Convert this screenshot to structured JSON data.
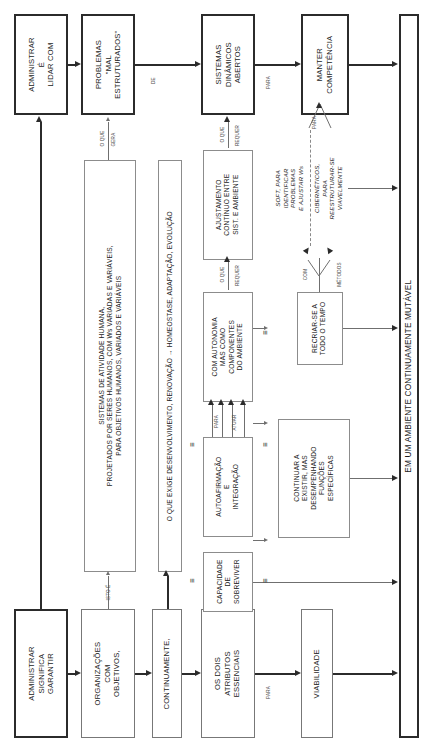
{
  "diagram": {
    "language": "pt-BR",
    "orientation": "rotated-90-ccw",
    "colors": {
      "ink": "#1a1a1a",
      "thick_border": "#2b2b2b",
      "thin_border": "#8c8c8c",
      "connector": "#2b2b2b",
      "connector_light": "#6f6f6f",
      "background": "#ffffff"
    }
  },
  "boxes": {
    "administrar_lidar": "ADMINISTRAR\nÉ\nLIDAR COM",
    "problemas_mal_estruturados": "PROBLEMAS\n\"MAL\nESTRUTURADOS\"",
    "sistemas_dinamicos_abertos": "SISTEMAS\nDINÂMICOS\nABERTOS",
    "manter_competencia": "MANTER\nCOMPETÊNCIA",
    "administrar_significa_garantir": "ADMINISTRAR\nSIGNIFICA\nGARANTIR",
    "organizacoes_com_objetivos": "ORGANIZAÇÕES\nCOM\nOBJETIVOS,",
    "continuamente": "CONTINUAMENTE,",
    "os_dois_atributos_essenciais": "OS DOIS\nATRIBUTOS\nESSENCIAIS",
    "viabilidade": "VIABILIDADE",
    "sistemas_atividade_humana": "SISTEMAS DE ATIVIDADE HUMANA,\nPROJETADOS POR SERES HUMANOS, COM Ws VARIADAS E VARIÁVEIS,\nPARA OBJETIVOS HUMANOS, VARIADOS E VARIÁVEIS",
    "o_que_exige": "O QUE EXIGE DESENVOLVIMENTO, RENOVAÇÃO → HOMEOSTASE, ADAPTAÇÃO, EVOLUÇÃO",
    "ajustamento_continuo": "AJUSTAMENTO\nCONTÍNUO ENTRE\nSIST. E AMBIENTE",
    "com_autonomia": "COM AUTONOMIA\nMAS COMO\nCOMPONENTES\nDO AMBIENTE",
    "autoafirmacao_integracao": "AUTOAFIRMAÇÃO\nE\nINTEGRAÇÃO",
    "continuar_a_existir": "CONTINUAR A\nEXISTIR, MAS\nDESEMPENHANDO\nFUNÇÕES\nESPECÍFICAS",
    "capacidade_de_sobreviver": "CAPACIDADE\nDE\nSOBREVIVER",
    "recriar_se": "RECRIAR-SE A\nTODO O TEMPO",
    "metodos_soft": "SOFT, PARA\nIDENTIFICAR\nPROBLEMAS\nE AJUSTAR Ws",
    "metodos_ciberneticos": "CIBERNÉTICOS,\nPARA\nREESTRUTURAR-SE\nVIAVELMENTE",
    "ambiente_mutavel": "EM UM AMBIENTE CONTINUAMENTE MUTÁVEL"
  },
  "connector_labels": {
    "de": "DE",
    "para_top": "PARA",
    "o_que_gera": "O QUE\nGERA",
    "isto_e": "ISTO É",
    "o_que_requer_1": "O QUE\nREQUER",
    "o_que_requer_2": "O QUE\nREQUER",
    "para_atuar": "PARA\nATUAR",
    "com_metodos": "COM\nMÉTODOS",
    "para_competencia": "PARA",
    "para_viabilidade": "PARA"
  },
  "equivalence_marks": [
    "≡",
    "≡",
    "≡",
    "≡",
    "≡"
  ]
}
